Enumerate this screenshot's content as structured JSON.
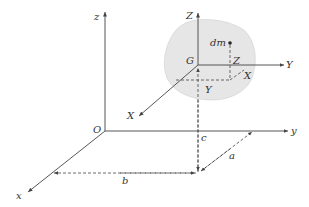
{
  "diagram": {
    "global_axes": {
      "origin": "O",
      "x": "x",
      "y": "y",
      "z": "z"
    },
    "centroid_axes": {
      "origin": "G",
      "x": "X",
      "y": "Y",
      "z": "Z"
    },
    "element": "dm",
    "element_offsets": {
      "x": "X",
      "y": "Y",
      "z": "Z"
    },
    "centroid_offsets": {
      "a": "a",
      "b": "b",
      "c": "c"
    },
    "colors": {
      "body_fill": "#e6e6e6",
      "line": "#444444"
    }
  }
}
